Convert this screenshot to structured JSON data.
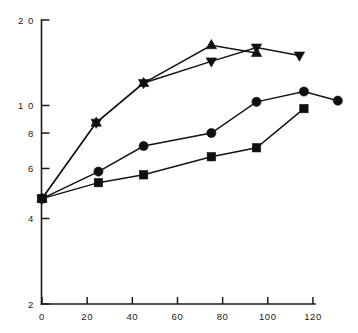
{
  "chart_data": {
    "type": "line",
    "title": "",
    "subtitle": "",
    "xlabel": "",
    "ylabel": "",
    "yscale": "log",
    "xscale": "linear",
    "xlim": [
      0,
      135
    ],
    "ylim": [
      2,
      20
    ],
    "grid": false,
    "legend": "none",
    "xticks": [
      0,
      20,
      40,
      60,
      80,
      100,
      120
    ],
    "xtick_labels": [
      "0",
      "20",
      "40",
      "60",
      "80",
      "100",
      "120"
    ],
    "yticks": [
      2,
      4,
      6,
      8,
      10,
      20
    ],
    "ytick_labels": [
      "2",
      "4",
      "6",
      "8",
      "1 0",
      "2 0"
    ],
    "series": [
      {
        "name": "up-triangle-series",
        "marker": "triangle-up",
        "color": "#101010",
        "x": [
          0,
          24,
          45,
          75,
          95
        ],
        "y": [
          4.7,
          8.7,
          12.0,
          16.3,
          15.3
        ]
      },
      {
        "name": "down-triangle-series",
        "marker": "triangle-down",
        "color": "#101010",
        "x": [
          0,
          24,
          45,
          75,
          95,
          114
        ],
        "y": [
          4.7,
          8.7,
          12.0,
          14.3,
          16.0,
          15.0
        ]
      },
      {
        "name": "circle-series",
        "marker": "circle",
        "color": "#101010",
        "x": [
          0,
          25,
          45,
          75,
          95,
          116,
          131
        ],
        "y": [
          4.7,
          5.85,
          7.2,
          8.0,
          10.3,
          11.2,
          10.4
        ]
      },
      {
        "name": "square-series",
        "marker": "square",
        "color": "#101010",
        "x": [
          0,
          25,
          45,
          75,
          95,
          116
        ],
        "y": [
          4.7,
          5.35,
          5.7,
          6.6,
          7.1,
          9.75
        ]
      }
    ]
  },
  "axes": {
    "y_axis_name": "y-axis",
    "x_axis_name": "x-axis"
  }
}
